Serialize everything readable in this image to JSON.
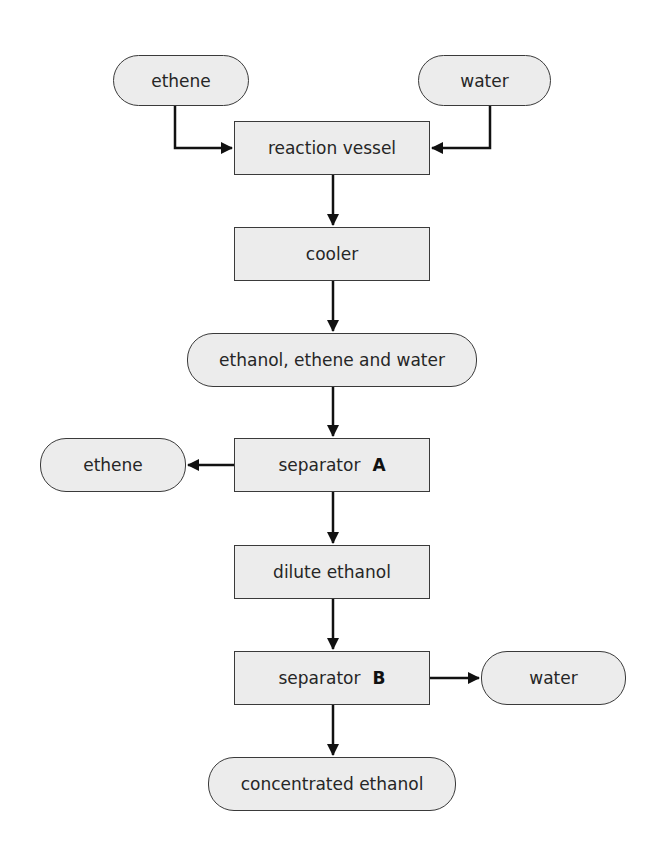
{
  "diagram": {
    "type": "flowchart",
    "title": "",
    "colors": {
      "node_fill": "#ececec",
      "node_border": "#3a3a3a",
      "arrow": "#111111",
      "text": "#262626"
    },
    "nodes": [
      {
        "id": "ethene_in",
        "shape": "pill",
        "label": "ethene",
        "x": 113,
        "y": 55,
        "w": 136,
        "h": 51
      },
      {
        "id": "water_in",
        "shape": "pill",
        "label": "water",
        "x": 418,
        "y": 55,
        "w": 133,
        "h": 51
      },
      {
        "id": "reaction_vessel",
        "shape": "rect",
        "label": "reaction vessel",
        "x": 234,
        "y": 121,
        "w": 196,
        "h": 54
      },
      {
        "id": "cooler",
        "shape": "rect",
        "label": "cooler",
        "x": 234,
        "y": 227,
        "w": 196,
        "h": 54
      },
      {
        "id": "mixture",
        "shape": "pill",
        "label": "ethanol, ethene and water",
        "x": 187,
        "y": 333,
        "w": 290,
        "h": 54
      },
      {
        "id": "separator_a",
        "shape": "rect",
        "label": "separator",
        "bold_suffix": "A",
        "x": 234,
        "y": 438,
        "w": 196,
        "h": 54
      },
      {
        "id": "ethene_out",
        "shape": "pill",
        "label": "ethene",
        "x": 40,
        "y": 438,
        "w": 146,
        "h": 54
      },
      {
        "id": "dilute_ethanol",
        "shape": "rect",
        "label": "dilute ethanol",
        "x": 234,
        "y": 545,
        "w": 196,
        "h": 54
      },
      {
        "id": "separator_b",
        "shape": "rect",
        "label": "separator",
        "bold_suffix": "B",
        "x": 234,
        "y": 651,
        "w": 196,
        "h": 54
      },
      {
        "id": "water_out",
        "shape": "pill",
        "label": "water",
        "x": 481,
        "y": 651,
        "w": 145,
        "h": 54
      },
      {
        "id": "concentrated_ethanol",
        "shape": "pill",
        "label": "concentrated ethanol",
        "x": 208,
        "y": 757,
        "w": 248,
        "h": 54
      }
    ],
    "edges": [
      {
        "from": "ethene_in",
        "to": "reaction_vessel",
        "path": [
          [
            175,
            106
          ],
          [
            175,
            148
          ],
          [
            232,
            148
          ]
        ]
      },
      {
        "from": "water_in",
        "to": "reaction_vessel",
        "path": [
          [
            490,
            106
          ],
          [
            490,
            148
          ],
          [
            432,
            148
          ]
        ]
      },
      {
        "from": "reaction_vessel",
        "to": "cooler",
        "path": [
          [
            333,
            175
          ],
          [
            333,
            225
          ]
        ]
      },
      {
        "from": "cooler",
        "to": "mixture",
        "path": [
          [
            333,
            281
          ],
          [
            333,
            331
          ]
        ]
      },
      {
        "from": "mixture",
        "to": "separator_a",
        "path": [
          [
            333,
            387
          ],
          [
            333,
            436
          ]
        ]
      },
      {
        "from": "separator_a",
        "to": "ethene_out",
        "path": [
          [
            234,
            465
          ],
          [
            188,
            465
          ]
        ]
      },
      {
        "from": "separator_a",
        "to": "dilute_ethanol",
        "path": [
          [
            333,
            492
          ],
          [
            333,
            543
          ]
        ]
      },
      {
        "from": "dilute_ethanol",
        "to": "separator_b",
        "path": [
          [
            333,
            599
          ],
          [
            333,
            649
          ]
        ]
      },
      {
        "from": "separator_b",
        "to": "water_out",
        "path": [
          [
            430,
            678
          ],
          [
            479,
            678
          ]
        ]
      },
      {
        "from": "separator_b",
        "to": "concentrated_ethanol",
        "path": [
          [
            333,
            705
          ],
          [
            333,
            755
          ]
        ]
      }
    ]
  }
}
